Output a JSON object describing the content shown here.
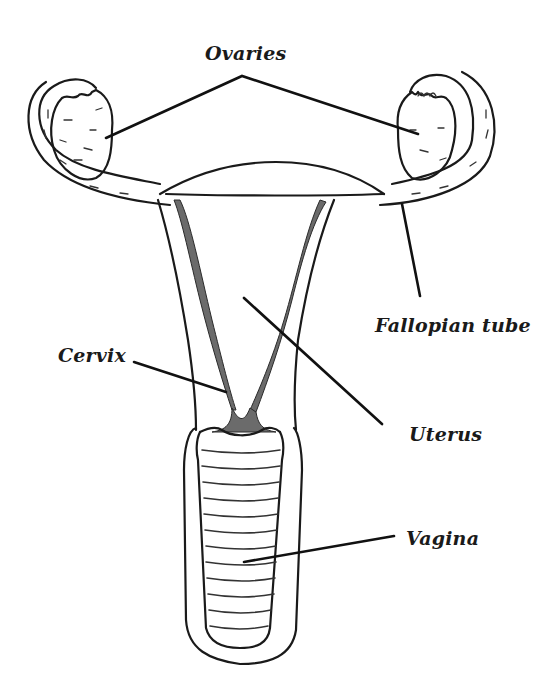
{
  "diagram": {
    "labels": {
      "ovaries": "Ovaries",
      "fallopian_tube": "Fallopian tube",
      "cervix": "Cervix",
      "uterus": "Uterus",
      "vagina": "Vagina"
    },
    "colors": {
      "ink": "#1a1a1a",
      "shading": "#6b6b6b",
      "background": "#ffffff"
    }
  }
}
